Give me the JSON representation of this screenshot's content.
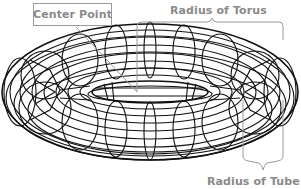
{
  "diagram": {
    "labels": {
      "center_point": "Center Point",
      "radius_of_torus": "Radius of Torus",
      "radius_of_tube": "Radius of Tube"
    },
    "colors": {
      "wireframe": "#111111",
      "annotation": "#8a8a8a",
      "background": "#ffffff"
    }
  }
}
